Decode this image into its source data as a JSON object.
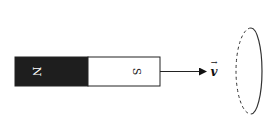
{
  "diagram": {
    "magnet": {
      "north_label": "N",
      "south_label": "S",
      "north_color": "#1e1e1e",
      "south_color": "#ffffff"
    },
    "velocity": {
      "label": "v",
      "vector_arrow": "→"
    },
    "loop": {
      "front_style": "solid",
      "back_style": "dashed"
    }
  }
}
